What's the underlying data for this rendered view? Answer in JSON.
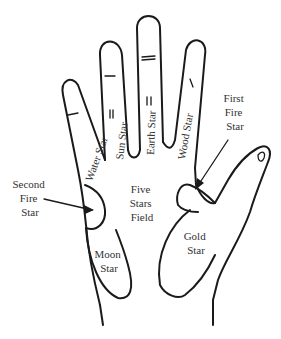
{
  "diagram": {
    "type": "palm-chart",
    "labels": {
      "water_star": "Water Star",
      "sun_star": "Sun Star",
      "earth_star": "Earth Star",
      "wood_star": "Wood Star",
      "first_fire_star": [
        "First",
        "Fire",
        "Star"
      ],
      "second_fire_star": [
        "Second",
        "Fire",
        "Star"
      ],
      "five_stars_field": [
        "Five",
        "Stars",
        "Field"
      ],
      "moon_star": [
        "Moon",
        "Star"
      ],
      "gold_star": [
        "Gold",
        "Star"
      ]
    },
    "colors": {
      "line": "#1a1a1a",
      "text": "#333333",
      "background": "#ffffff"
    }
  }
}
